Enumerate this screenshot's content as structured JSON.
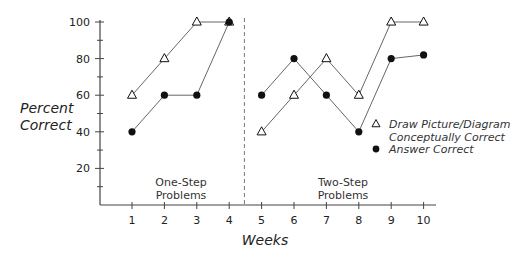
{
  "chart_data": {
    "type": "line",
    "title": "",
    "xlabel": "Weeks",
    "ylabel": "Percent Correct",
    "ylabel_lines": [
      "Percent",
      "Correct"
    ],
    "x": [
      1,
      2,
      3,
      4,
      5,
      6,
      7,
      8,
      9,
      10
    ],
    "x_tick_labels": [
      "1",
      "2",
      "3",
      "4",
      "5",
      "6",
      "7",
      "8",
      "9",
      "10"
    ],
    "y_ticks": [
      20,
      40,
      60,
      80,
      100
    ],
    "y_tick_labels": [
      "20",
      "40",
      "60",
      "80",
      "100"
    ],
    "y_minor_ticks": [
      10,
      30,
      50,
      70,
      90
    ],
    "ylim": [
      0,
      100
    ],
    "xlim": [
      0,
      10.4
    ],
    "grid": false,
    "phase_divider_x": 4.5,
    "phases": [
      {
        "label_lines": [
          "One-Step",
          "Problems"
        ],
        "weeks": [
          1,
          2,
          3,
          4
        ]
      },
      {
        "label_lines": [
          "Two-Step",
          "Problems"
        ],
        "weeks": [
          5,
          6,
          7,
          8,
          9,
          10
        ]
      }
    ],
    "series": [
      {
        "name": "Draw Picture/Diagram Conceptually Correct",
        "legend_lines": [
          "Draw Picture/Diagram",
          "Conceptually Correct"
        ],
        "marker": "open-triangle",
        "segments": [
          {
            "x": [
              1,
              2,
              3,
              4
            ],
            "values": [
              60,
              80,
              100,
              100
            ]
          },
          {
            "x": [
              5,
              6,
              7,
              8,
              9,
              10
            ],
            "values": [
              40,
              60,
              80,
              60,
              100,
              100
            ]
          }
        ]
      },
      {
        "name": "Answer Correct",
        "legend_lines": [
          "Answer Correct"
        ],
        "marker": "filled-circle",
        "segments": [
          {
            "x": [
              1,
              2,
              3,
              4
            ],
            "values": [
              40,
              60,
              60,
              100
            ]
          },
          {
            "x": [
              5,
              6,
              7,
              8,
              9,
              10
            ],
            "values": [
              60,
              80,
              60,
              40,
              80,
              82
            ]
          }
        ]
      }
    ],
    "legend_position": "right-middle"
  },
  "colors": {
    "axis": "#444444",
    "line": "#666666",
    "marker": "#111111",
    "divider": "#777777"
  }
}
